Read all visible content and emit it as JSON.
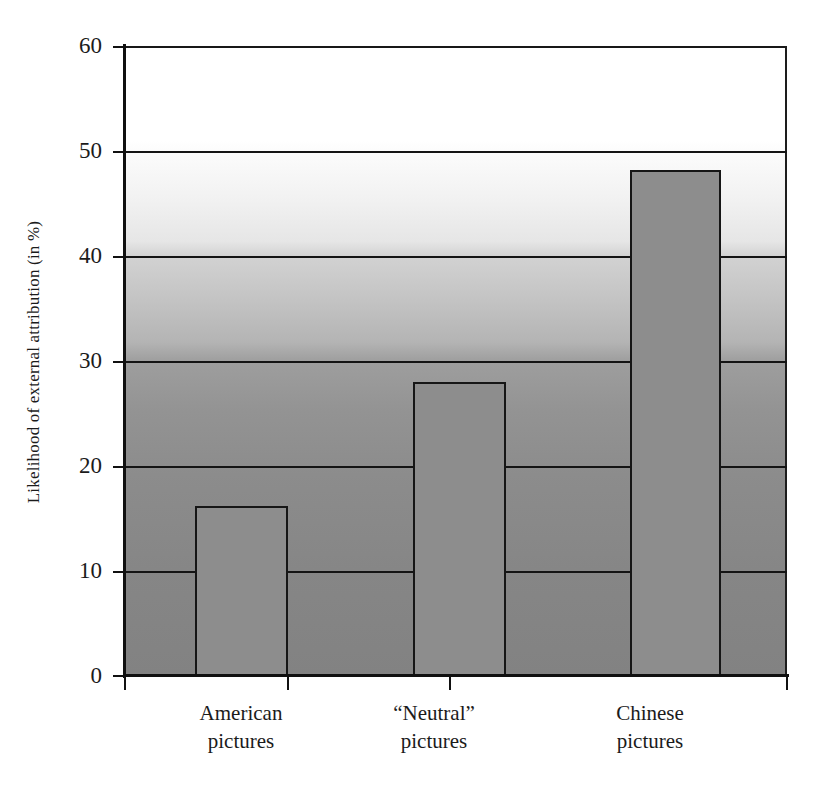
{
  "chart_data": {
    "type": "bar",
    "title": "",
    "xlabel": "",
    "ylabel": "Likelihood of external attribution (in %)",
    "categories": [
      "American pictures",
      "\"Neutral\" pictures",
      "Chinese pictures"
    ],
    "category_lines": [
      [
        "American",
        "pictures"
      ],
      [
        "“Neutral”",
        "pictures"
      ],
      [
        "Chinese",
        "pictures"
      ]
    ],
    "values": [
      16.2,
      28.0,
      48.2
    ],
    "ylim": [
      0,
      60
    ],
    "yticks": [
      0,
      10,
      20,
      30,
      40,
      50,
      60
    ],
    "ytick_labels": [
      "0",
      "10",
      "20",
      "30",
      "40",
      "50",
      "60"
    ],
    "grid": "horizontal",
    "legend": "none",
    "bar_color": "#8d8d8d",
    "bar_edge_color": "#161616",
    "axis_color": "#101010",
    "plot_background": "vertical-gradient-white-to-gray"
  }
}
